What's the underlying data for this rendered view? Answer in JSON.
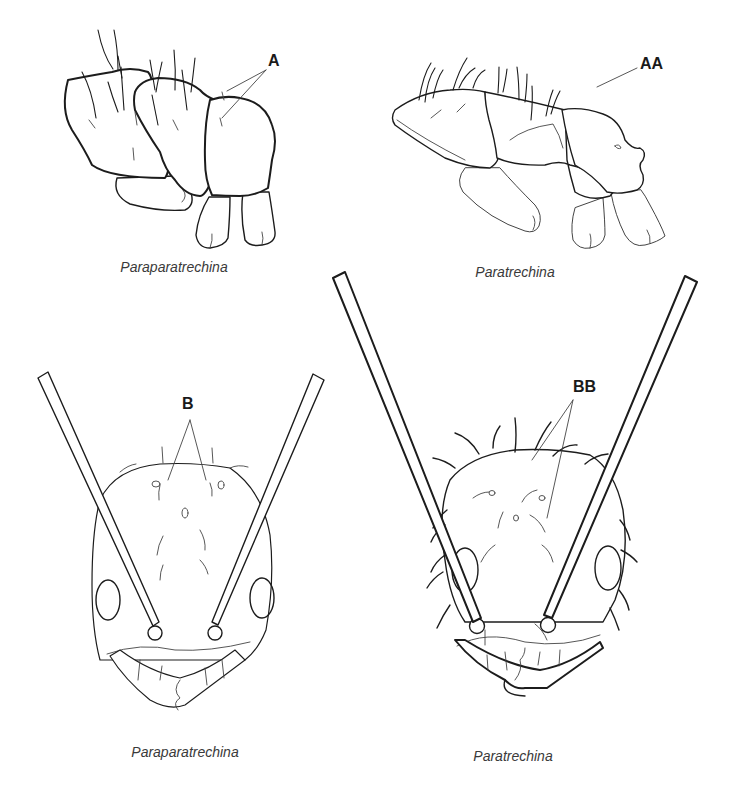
{
  "figure": {
    "panels": [
      {
        "id": "mesosoma-paraparatrechina",
        "view": "lateral mesosoma",
        "caption": "Paraparatrechina",
        "callout": "A"
      },
      {
        "id": "mesosoma-paratrechina",
        "view": "lateral mesosoma",
        "caption": "Paratrechina",
        "callout": "AA"
      },
      {
        "id": "head-paraparatrechina",
        "view": "full-face head",
        "caption": "Paraparatrechina",
        "callout": "B"
      },
      {
        "id": "head-paratrechina",
        "view": "full-face head",
        "caption": "Paratrechina",
        "callout": "BB"
      }
    ]
  },
  "colors": {
    "background": "#ffffff",
    "line": "#1c1c1c",
    "caption_text": "#3a3a3a"
  }
}
